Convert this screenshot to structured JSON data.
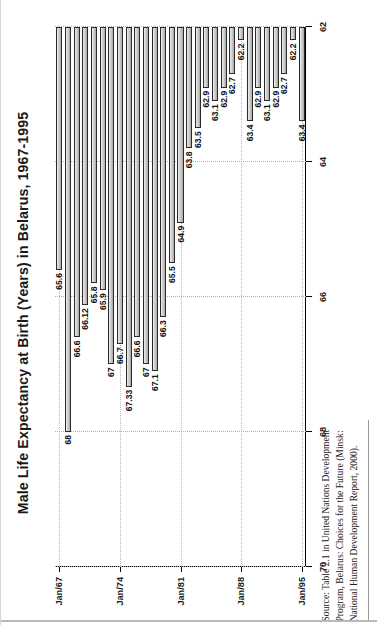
{
  "title": "Male Life Expectancy at Birth (Years) in Belarus, 1967-1995",
  "source_note": "Source: Table 2.1 in United Nations Development Program, Belarus: Choices for the Future (Minsk: National Human Development Report, 2000).",
  "chart_data": {
    "type": "bar",
    "orientation": "horizontal",
    "title": "Male Life Expectancy at Birth (Years) in Belarus, 1967-1995",
    "xlabel": "",
    "ylabel": "",
    "value_axis_label": "Years",
    "category_axis_label": "Date",
    "xlim": [
      70,
      62
    ],
    "axis_reversed": true,
    "baseline": 62,
    "ticks": [
      70,
      68,
      66,
      64,
      62
    ],
    "grid": true,
    "legend": "none",
    "categories": [
      "Jan/67",
      "Jan/68",
      "Jan/69",
      "Jan/70",
      "Jan/71",
      "Jan/72",
      "Jan/73",
      "Jan/74",
      "Jan/75",
      "Jan/76",
      "Jan/77",
      "Jan/78",
      "Jan/79",
      "Jan/80",
      "Jan/81",
      "Jan/82",
      "Jan/83",
      "Jan/84",
      "Jan/85",
      "Jan/86",
      "Jan/87",
      "Jan/88",
      "Jan/89",
      "Jan/90",
      "Jan/91",
      "Jan/92",
      "Jan/93",
      "Jan/94",
      "Jan/95"
    ],
    "category_ticks": [
      "Jan/67",
      "Jan/74",
      "Jan/81",
      "Jan/88",
      "Jan/95"
    ],
    "values": [
      65.6,
      68,
      66.6,
      66.12,
      65.8,
      65.9,
      67,
      66.7,
      67.33,
      66.6,
      67,
      67.1,
      66.3,
      65.5,
      64.9,
      63.8,
      63.5,
      62.9,
      63.1,
      62.9,
      62.7,
      62.2,
      63.4,
      62.9,
      63.1,
      62.9,
      62.7,
      62.2,
      63.4
    ],
    "data_labels": [
      "65.6",
      "68",
      "66.6",
      "66.12",
      "65.8",
      "65.9",
      "67",
      "66.7",
      "67.33",
      "66.6",
      "67",
      "67.1",
      "66.3",
      "65.5",
      "64.9",
      "63.8",
      "63.5",
      "62.9",
      "63.1",
      "62.9",
      "62.7",
      "62.2",
      "63.4",
      "62.9",
      "63.1",
      "62.9",
      "62.7",
      "62.2",
      "63.4"
    ]
  }
}
